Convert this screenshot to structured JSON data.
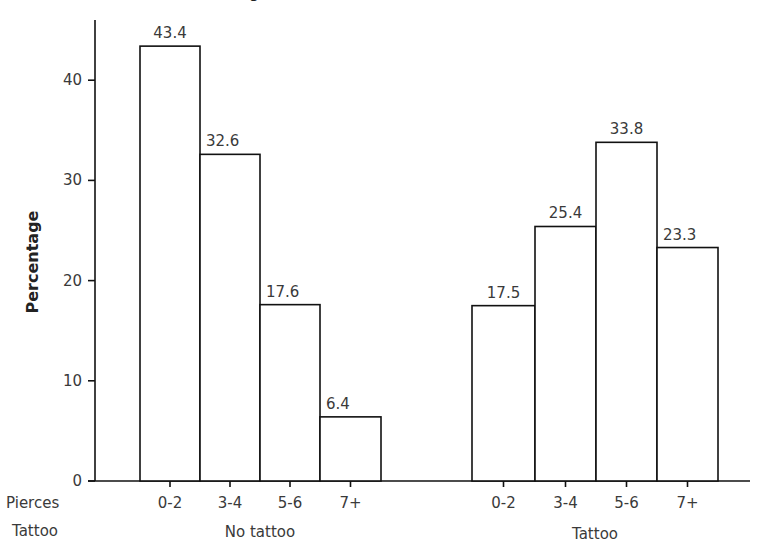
{
  "chart_data": {
    "type": "bar",
    "title": "",
    "title_fragment_visible": "g",
    "ylabel": "Percentage",
    "xlabel": "",
    "ylim": [
      0,
      46
    ],
    "yticks": [
      0,
      10,
      20,
      30,
      40
    ],
    "grid": false,
    "legend": null,
    "row_labels": [
      "Pierces",
      "Tattoo"
    ],
    "groups": [
      {
        "name": "No tattoo",
        "categories": [
          "0-2",
          "3-4",
          "5-6",
          "7+"
        ],
        "values": [
          43.4,
          32.6,
          17.6,
          6.4
        ]
      },
      {
        "name": "Tattoo",
        "categories": [
          "0-2",
          "3-4",
          "5-6",
          "7+"
        ],
        "values": [
          17.5,
          25.4,
          33.8,
          23.3
        ]
      }
    ],
    "bar_fill": "#ffffff",
    "bar_stroke": "#111111"
  }
}
